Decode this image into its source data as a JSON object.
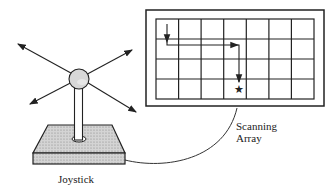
{
  "diagram": {
    "labels": {
      "joystick": "Joystick",
      "array_line1": "Scanning",
      "array_line2": "Array"
    },
    "grid": {
      "columns": 7,
      "rows": 4
    },
    "scan_path": "down, right, down to target",
    "target_icon": "star-icon",
    "colors": {
      "line": "#222222",
      "shade": "#cfcfcf"
    }
  }
}
